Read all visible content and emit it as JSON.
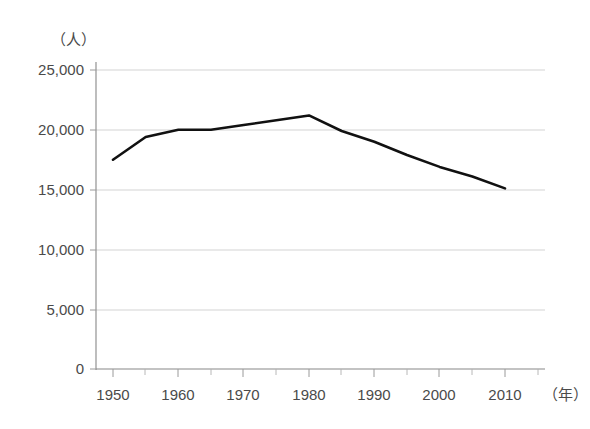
{
  "chart_data": {
    "type": "line",
    "title": "",
    "subtitle": "",
    "xlabel": "（年）",
    "ylabel": "（人）",
    "x": [
      1950,
      1955,
      1960,
      1965,
      1970,
      1975,
      1980,
      1985,
      1990,
      1995,
      2000,
      2005,
      2010
    ],
    "series": [
      {
        "name": "人口",
        "values": [
          17500,
          19400,
          20000,
          20000,
          20400,
          20800,
          21200,
          19900,
          19000,
          17900,
          16900,
          16100,
          15100
        ]
      }
    ],
    "xlim": [
      1950,
      2010
    ],
    "ylim": [
      0,
      25000
    ],
    "x_tick_labels": [
      "1950",
      "1960",
      "1970",
      "1980",
      "1990",
      "2000",
      "2010"
    ],
    "x_tick_values": [
      1950,
      1960,
      1970,
      1980,
      1990,
      2000,
      2010
    ],
    "x_minor_tick_values": [
      1955,
      1965,
      1975,
      1985,
      1995,
      2005
    ],
    "y_tick_labels": [
      "0",
      "5,000",
      "10,000",
      "15,000",
      "20,000",
      "25,000"
    ],
    "y_tick_values": [
      0,
      5000,
      10000,
      15000,
      20000,
      25000
    ],
    "grid": "horizontal",
    "legend": "none",
    "annotations": [],
    "colors": {
      "line": "#111111",
      "grid": "#c8c8c8",
      "axis": "#888888",
      "text": "#4a4a4a",
      "background": "#ffffff"
    }
  },
  "axis": {
    "y_unit": "（人）",
    "x_unit": "（年）",
    "y_labels": [
      "25,000",
      "20,000",
      "15,000",
      "10,000",
      "5,000",
      "0"
    ],
    "x_labels": [
      "1950",
      "1960",
      "1970",
      "1980",
      "1990",
      "2000",
      "2010"
    ]
  }
}
